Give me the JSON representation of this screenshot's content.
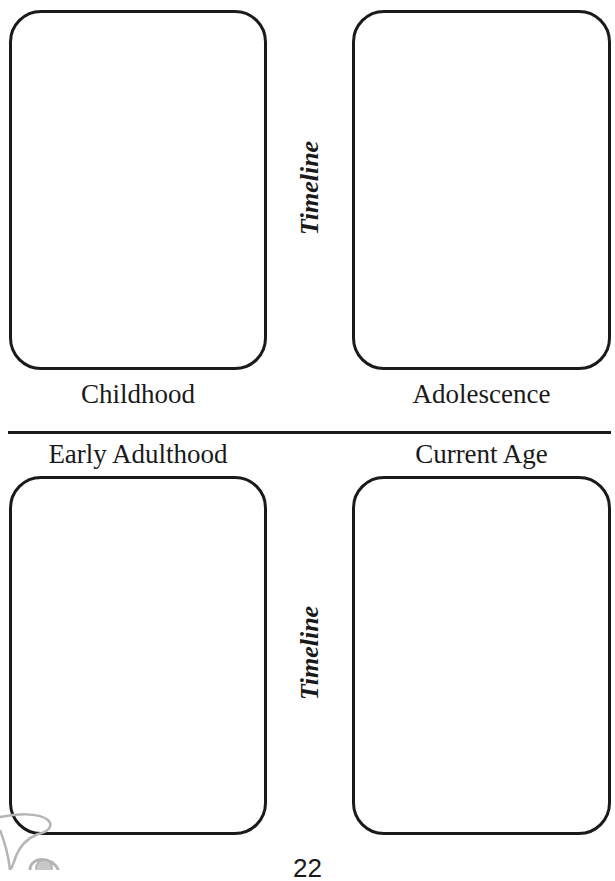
{
  "worksheet": {
    "sections": [
      {
        "id": "childhood",
        "label": "Childhood"
      },
      {
        "id": "adolescence",
        "label": "Adolescence"
      },
      {
        "id": "early-adulthood",
        "label": "Early Adulthood"
      },
      {
        "id": "current-age",
        "label": "Current Age"
      }
    ],
    "timeline_labels": [
      "Timeline",
      "Timeline"
    ],
    "page_number": "22",
    "decoration": "flower-outline-icon",
    "colors": {
      "ink": "#1a1a1a",
      "background": "#ffffff",
      "decoration": "#b5b5b5"
    }
  }
}
